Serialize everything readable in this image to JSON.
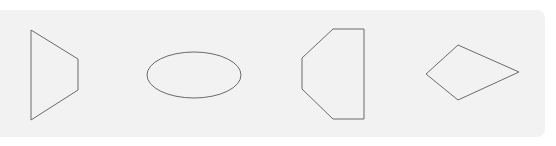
{
  "figure": {
    "background": "#ffffff",
    "panel_color": "#f2f2f2",
    "stroke_color": "#6b6b6b",
    "shapes": [
      {
        "name": "trapezoid",
        "type": "polygon",
        "points": "31,30 78,59 78,90 31,120"
      },
      {
        "name": "ellipse",
        "type": "ellipse",
        "cx": 194,
        "cy": 75,
        "rx": 47,
        "ry": 23
      },
      {
        "name": "truncated-pentagon",
        "type": "polygon",
        "points": "333,29 364,29 364,119 333,119 302,89 302,58"
      },
      {
        "name": "kite",
        "type": "polygon",
        "points": "458,45 519,72 458,100 426,74"
      }
    ]
  }
}
